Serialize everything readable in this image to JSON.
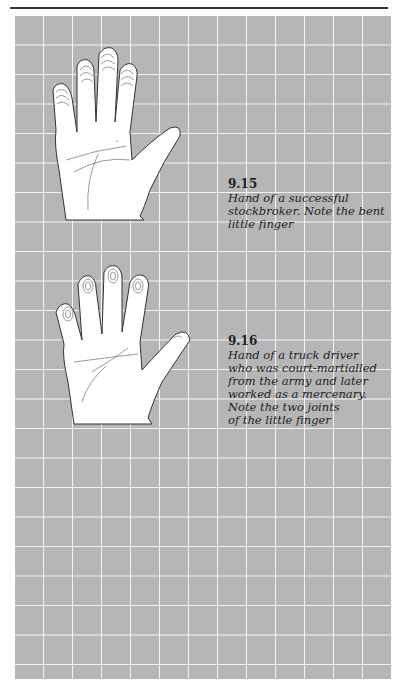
{
  "page": {
    "running_head_visible": "clipped header text (illegible)",
    "background_color": "#ffffff",
    "grid": {
      "cell_color": "#b6b6b6",
      "line_color": "#f4f4f4",
      "columns": 13,
      "rows": 23
    }
  },
  "figures": [
    {
      "number": "9.15",
      "caption": "Hand of a successful stockbroker. Note the bent little finger",
      "caption_lines": [
        "Hand of a successful",
        "stockbroker. Note the bent",
        "little finger"
      ],
      "image": "hand-print-outline"
    },
    {
      "number": "9.16",
      "caption": "Hand of a truck driver who was court-martialled from the army and later worked as a mercenary. Note the two joints of the little finger",
      "caption_lines": [
        "Hand of a truck driver",
        "who was court-martialled",
        "from the army and later",
        "worked as a mercenary.",
        "Note the two joints",
        "of the little finger"
      ],
      "image": "hand-print-outline"
    }
  ]
}
